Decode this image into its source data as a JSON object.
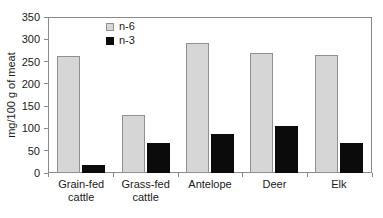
{
  "chart_data": {
    "type": "bar",
    "title": "",
    "xlabel": "",
    "ylabel": "mg/100 g of meat",
    "ylim": [
      0,
      350
    ],
    "ytick_step": 50,
    "yticks": [
      350,
      300,
      250,
      200,
      150,
      100,
      50,
      0
    ],
    "grid": false,
    "legend_position": "inside-top-left",
    "categories": [
      "Grain-fed cattle",
      "Grass-fed cattle",
      "Antelope",
      "Deer",
      "Elk"
    ],
    "category_lines": [
      [
        "Grain-fed",
        "cattle"
      ],
      [
        "Grass-fed",
        "cattle"
      ],
      [
        "Antelope",
        ""
      ],
      [
        "Deer",
        ""
      ],
      [
        "Elk",
        ""
      ]
    ],
    "series": [
      {
        "name": "n-6",
        "color": "#d6d6d6",
        "border_color": "#8f8f8f",
        "values": [
          262,
          130,
          292,
          269,
          265
        ]
      },
      {
        "name": "n-3",
        "color": "#0b0b0b",
        "border_color": "#0b0b0b",
        "values": [
          17,
          67,
          87,
          105,
          67
        ]
      }
    ]
  },
  "axis": {
    "frame_color": "#8a8a8a",
    "text_color": "#1a1a1a"
  }
}
